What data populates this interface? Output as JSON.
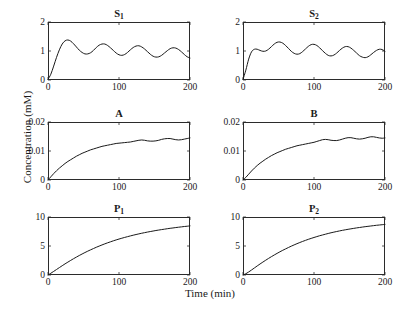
{
  "figure": {
    "xlabel": "Time (min)",
    "ylabel": "Concentration (mM)",
    "line_color": "#1a1a1a",
    "frame_color": "#2b2b2b"
  },
  "chart_data": [
    {
      "type": "line",
      "title": "S1",
      "title_main": "S",
      "title_sub": "1",
      "xlabel": "Time (min)",
      "ylabel": "Concentration (mM)",
      "xlim": [
        0,
        200
      ],
      "ylim": [
        0,
        2
      ],
      "xticks": [
        0,
        100,
        200
      ],
      "xticklabels": [
        "0",
        "100",
        "200"
      ],
      "yticks": [
        0,
        1,
        2
      ],
      "yticklabels": [
        "0",
        "1",
        "2"
      ],
      "grid": false,
      "legend": "none",
      "x": [
        0,
        4,
        8,
        12,
        16,
        20,
        24,
        28,
        32,
        36,
        40,
        44,
        48,
        52,
        56,
        60,
        64,
        68,
        72,
        76,
        80,
        84,
        88,
        92,
        96,
        100,
        104,
        108,
        112,
        116,
        120,
        124,
        128,
        132,
        136,
        140,
        144,
        148,
        152,
        156,
        160,
        164,
        168,
        172,
        176,
        180,
        184,
        188,
        192,
        196,
        200
      ],
      "y": [
        0.02,
        0.2,
        0.48,
        0.78,
        1.04,
        1.24,
        1.35,
        1.38,
        1.34,
        1.25,
        1.14,
        1.03,
        0.95,
        0.9,
        0.9,
        0.94,
        1.02,
        1.12,
        1.2,
        1.24,
        1.24,
        1.19,
        1.11,
        1.02,
        0.93,
        0.87,
        0.85,
        0.88,
        0.95,
        1.04,
        1.12,
        1.17,
        1.18,
        1.14,
        1.07,
        0.98,
        0.89,
        0.82,
        0.79,
        0.8,
        0.85,
        0.93,
        1.01,
        1.08,
        1.11,
        1.1,
        1.05,
        0.97,
        0.88,
        0.8,
        0.76
      ]
    },
    {
      "type": "line",
      "title": "S2",
      "title_main": "S",
      "title_sub": "2",
      "xlabel": "Time (min)",
      "ylabel": "Concentration (mM)",
      "xlim": [
        0,
        200
      ],
      "ylim": [
        0,
        2
      ],
      "xticks": [
        0,
        100,
        200
      ],
      "xticklabels": [
        "0",
        "100",
        "200"
      ],
      "yticks": [
        0,
        1,
        2
      ],
      "yticklabels": [
        "0",
        "1",
        "2"
      ],
      "grid": false,
      "legend": "none",
      "x": [
        0,
        4,
        8,
        12,
        16,
        20,
        24,
        28,
        32,
        36,
        40,
        44,
        48,
        52,
        56,
        60,
        64,
        68,
        72,
        76,
        80,
        84,
        88,
        92,
        96,
        100,
        104,
        108,
        112,
        116,
        120,
        124,
        128,
        132,
        136,
        140,
        144,
        148,
        152,
        156,
        160,
        164,
        168,
        172,
        176,
        180,
        184,
        188,
        192,
        196,
        200
      ],
      "y": [
        0.02,
        0.34,
        0.72,
        0.97,
        1.06,
        1.06,
        1.02,
        0.99,
        1.0,
        1.06,
        1.15,
        1.24,
        1.3,
        1.31,
        1.27,
        1.19,
        1.09,
        0.99,
        0.92,
        0.89,
        0.91,
        0.98,
        1.07,
        1.16,
        1.22,
        1.23,
        1.19,
        1.11,
        1.01,
        0.92,
        0.85,
        0.83,
        0.86,
        0.93,
        1.02,
        1.1,
        1.15,
        1.15,
        1.1,
        1.02,
        0.93,
        0.84,
        0.79,
        0.77,
        0.8,
        0.87,
        0.95,
        1.02,
        1.06,
        1.05,
        0.99
      ]
    },
    {
      "type": "line",
      "title": "A",
      "title_main": "A",
      "title_sub": "",
      "xlabel": "Time (min)",
      "ylabel": "Concentration (mM)",
      "xlim": [
        0,
        200
      ],
      "ylim": [
        0,
        0.02
      ],
      "xticks": [
        0,
        100,
        200
      ],
      "xticklabels": [
        "0",
        "100",
        "200"
      ],
      "yticks": [
        0,
        0.01,
        0.02
      ],
      "yticklabels": [
        "0",
        "0.01",
        "0.02"
      ],
      "grid": false,
      "legend": "none",
      "x": [
        0,
        4,
        8,
        12,
        16,
        20,
        24,
        28,
        32,
        36,
        40,
        44,
        48,
        52,
        56,
        60,
        64,
        68,
        72,
        76,
        80,
        84,
        88,
        92,
        96,
        100,
        104,
        108,
        112,
        116,
        120,
        124,
        128,
        132,
        136,
        140,
        144,
        148,
        152,
        156,
        160,
        164,
        168,
        172,
        176,
        180,
        184,
        188,
        192,
        196,
        200
      ],
      "y": [
        0.0,
        0.0011,
        0.0022,
        0.0032,
        0.0041,
        0.0049,
        0.0057,
        0.0064,
        0.007,
        0.0076,
        0.0082,
        0.0087,
        0.0092,
        0.0096,
        0.01,
        0.0104,
        0.0107,
        0.011,
        0.0113,
        0.0116,
        0.0118,
        0.012,
        0.0122,
        0.0124,
        0.0126,
        0.0127,
        0.0128,
        0.0129,
        0.013,
        0.0131,
        0.0133,
        0.0135,
        0.0137,
        0.0138,
        0.0137,
        0.0135,
        0.0134,
        0.0134,
        0.0135,
        0.0137,
        0.014,
        0.0142,
        0.0143,
        0.0143,
        0.0141,
        0.0139,
        0.0138,
        0.0139,
        0.0141,
        0.0143,
        0.0145
      ]
    },
    {
      "type": "line",
      "title": "B",
      "title_main": "B",
      "title_sub": "",
      "xlabel": "Time (min)",
      "ylabel": "Concentration (mM)",
      "xlim": [
        0,
        200
      ],
      "ylim": [
        0,
        0.02
      ],
      "xticks": [
        0,
        100,
        200
      ],
      "xticklabels": [
        "0",
        "100",
        "200"
      ],
      "yticks": [
        0,
        0.01,
        0.02
      ],
      "yticklabels": [
        "0",
        "0.01",
        "0.02"
      ],
      "grid": false,
      "legend": "none",
      "x": [
        0,
        4,
        8,
        12,
        16,
        20,
        24,
        28,
        32,
        36,
        40,
        44,
        48,
        52,
        56,
        60,
        64,
        68,
        72,
        76,
        80,
        84,
        88,
        92,
        96,
        100,
        104,
        108,
        112,
        116,
        120,
        124,
        128,
        132,
        136,
        140,
        144,
        148,
        152,
        156,
        160,
        164,
        168,
        172,
        176,
        180,
        184,
        188,
        192,
        196,
        200
      ],
      "y": [
        0.0,
        0.0009,
        0.002,
        0.0031,
        0.0041,
        0.005,
        0.0058,
        0.0065,
        0.0072,
        0.0078,
        0.0084,
        0.0089,
        0.0094,
        0.0098,
        0.0102,
        0.0106,
        0.0109,
        0.0112,
        0.0115,
        0.0118,
        0.012,
        0.0122,
        0.0124,
        0.0126,
        0.0128,
        0.013,
        0.0133,
        0.0136,
        0.0139,
        0.014,
        0.0139,
        0.0137,
        0.0136,
        0.0136,
        0.0138,
        0.0141,
        0.0144,
        0.0146,
        0.0146,
        0.0144,
        0.0142,
        0.0141,
        0.0142,
        0.0144,
        0.0147,
        0.0149,
        0.0149,
        0.0147,
        0.0145,
        0.0144,
        0.0145
      ]
    },
    {
      "type": "line",
      "title": "P1",
      "title_main": "P",
      "title_sub": "1",
      "xlabel": "Time (min)",
      "ylabel": "Concentration (mM)",
      "xlim": [
        0,
        200
      ],
      "ylim": [
        0,
        10
      ],
      "xticks": [
        0,
        100,
        200
      ],
      "xticklabels": [
        "0",
        "100",
        "200"
      ],
      "yticks": [
        0,
        5,
        10
      ],
      "yticklabels": [
        "0",
        "5",
        "10"
      ],
      "grid": false,
      "legend": "none",
      "x": [
        0,
        4,
        8,
        12,
        16,
        20,
        24,
        28,
        32,
        36,
        40,
        44,
        48,
        52,
        56,
        60,
        64,
        68,
        72,
        76,
        80,
        84,
        88,
        92,
        96,
        100,
        104,
        108,
        112,
        116,
        120,
        124,
        128,
        132,
        136,
        140,
        144,
        148,
        152,
        156,
        160,
        164,
        168,
        172,
        176,
        180,
        184,
        188,
        192,
        196,
        200
      ],
      "y": [
        0.0,
        0.3,
        0.62,
        0.95,
        1.28,
        1.6,
        1.92,
        2.22,
        2.52,
        2.81,
        3.09,
        3.36,
        3.62,
        3.87,
        4.11,
        4.34,
        4.56,
        4.78,
        4.98,
        5.18,
        5.37,
        5.55,
        5.72,
        5.89,
        6.05,
        6.2,
        6.34,
        6.48,
        6.61,
        6.74,
        6.86,
        6.98,
        7.09,
        7.2,
        7.3,
        7.4,
        7.49,
        7.58,
        7.67,
        7.75,
        7.83,
        7.9,
        7.98,
        8.05,
        8.11,
        8.18,
        8.24,
        8.3,
        8.36,
        8.41,
        8.47
      ]
    },
    {
      "type": "line",
      "title": "P2",
      "title_main": "P",
      "title_sub": "2",
      "xlabel": "Time (min)",
      "ylabel": "Concentration (mM)",
      "xlim": [
        0,
        200
      ],
      "ylim": [
        0,
        10
      ],
      "xticks": [
        0,
        100,
        200
      ],
      "xticklabels": [
        "0",
        "100",
        "200"
      ],
      "yticks": [
        0,
        5,
        10
      ],
      "yticklabels": [
        "0",
        "5",
        "10"
      ],
      "grid": false,
      "legend": "none",
      "x": [
        0,
        4,
        8,
        12,
        16,
        20,
        24,
        28,
        32,
        36,
        40,
        44,
        48,
        52,
        56,
        60,
        64,
        68,
        72,
        76,
        80,
        84,
        88,
        92,
        96,
        100,
        104,
        108,
        112,
        116,
        120,
        124,
        128,
        132,
        136,
        140,
        144,
        148,
        152,
        156,
        160,
        164,
        168,
        172,
        176,
        180,
        184,
        188,
        192,
        196,
        200
      ],
      "y": [
        0.0,
        0.22,
        0.52,
        0.86,
        1.21,
        1.56,
        1.9,
        2.23,
        2.55,
        2.86,
        3.16,
        3.45,
        3.73,
        4.0,
        4.26,
        4.5,
        4.74,
        4.97,
        5.19,
        5.4,
        5.6,
        5.79,
        5.97,
        6.15,
        6.31,
        6.47,
        6.62,
        6.77,
        6.9,
        7.03,
        7.16,
        7.28,
        7.39,
        7.5,
        7.6,
        7.7,
        7.79,
        7.88,
        7.96,
        8.04,
        8.12,
        8.19,
        8.26,
        8.33,
        8.39,
        8.45,
        8.51,
        8.57,
        8.62,
        8.67,
        8.72
      ]
    }
  ]
}
